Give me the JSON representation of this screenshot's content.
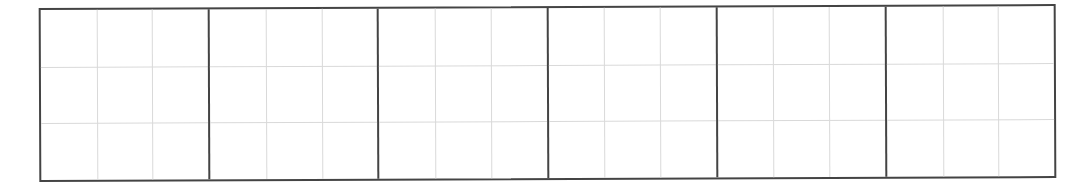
{
  "sheet": {
    "type": "writing-practice-grid",
    "square_count": 6,
    "subdivisions": {
      "rows": 3,
      "cols": 3
    },
    "colors": {
      "outer_border": "#444444",
      "inner_guides": "#d9d9d9",
      "background": "#ffffff"
    },
    "squares": [
      {
        "index": 1,
        "content": ""
      },
      {
        "index": 2,
        "content": ""
      },
      {
        "index": 3,
        "content": ""
      },
      {
        "index": 4,
        "content": ""
      },
      {
        "index": 5,
        "content": ""
      },
      {
        "index": 6,
        "content": ""
      }
    ]
  }
}
